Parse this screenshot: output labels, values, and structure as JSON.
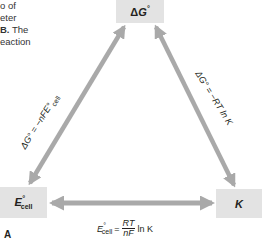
{
  "caption": {
    "lines": [
      "o of",
      "eter",
      "B. The",
      "eaction"
    ],
    "bold_fragment": "B."
  },
  "nodes": {
    "delta_g": {
      "label": "ΔG°",
      "symbol": "ΔG",
      "superscript": "°"
    },
    "e_cell": {
      "label": "E°cell",
      "symbol": "E",
      "superscript": "°",
      "subscript": "cell"
    },
    "k": {
      "label": "K",
      "symbol": "K"
    }
  },
  "equations": {
    "left": {
      "text": "ΔG° = −nFE°cell",
      "lhs": "ΔG° = −nFE°",
      "sub": "cell"
    },
    "right": {
      "text": "ΔG° = −RT ln K"
    },
    "bottom": {
      "lhs_symbol": "E",
      "lhs_sup": "°",
      "lhs_sub": "cell",
      "equals": "=",
      "numerator": "RT",
      "denominator": "nF",
      "tail": "ln K"
    }
  },
  "panel_label": "A",
  "colors": {
    "box_fill": "#e3e3e3",
    "arrow": "#a9a9a9",
    "text": "#231f20"
  }
}
